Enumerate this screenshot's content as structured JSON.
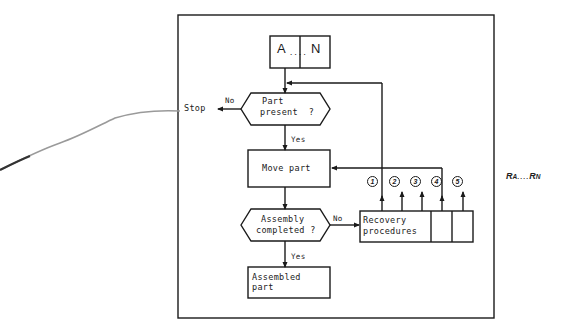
{
  "diagram": {
    "type": "flowchart",
    "input_block": {
      "left": "A",
      "dots": "....",
      "right": "N"
    },
    "nodes": {
      "part_present": {
        "line1": "Part",
        "line2": "present  ?"
      },
      "stop": "Stop",
      "move_part": "Move part",
      "assembly_completed": {
        "line1": "Assembly",
        "line2": "completed ?"
      },
      "recovery": {
        "line1": "Recovery",
        "line2": "procedures"
      },
      "assembled_part": {
        "line1": "Assembled",
        "line2": "part"
      }
    },
    "edge_labels": {
      "part_present_no": "No",
      "part_present_yes": "Yes",
      "assembly_no": "No",
      "assembly_yes": "Yes"
    },
    "recovery_paths": [
      "1",
      "2",
      "3",
      "4",
      "5"
    ],
    "side_label": {
      "left": "R",
      "left_sub": "A",
      "dots": "....",
      "right": "R",
      "right_sub": "N"
    }
  },
  "colors": {
    "line": "#1a1a1a",
    "background": "#ffffff",
    "scribble": "#9a9a9a"
  }
}
